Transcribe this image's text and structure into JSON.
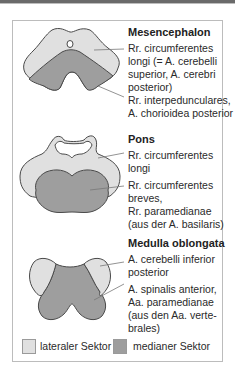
{
  "colors": {
    "lateral": "#e0e0e0",
    "median": "#9e9e9e",
    "outline": "#4a4a4a",
    "frame": "#bcbcbc"
  },
  "sections": [
    {
      "title": "Mesencephalon",
      "labels": [
        {
          "lines": [
            "Rr. circumferentes",
            "longi (= A. cerebelli",
            "superior, A. cerebri",
            "posterior)"
          ]
        },
        {
          "lines": [
            "Rr. interpedunculares,",
            "A. chorioidea posterior"
          ]
        }
      ]
    },
    {
      "title": "Pons",
      "labels": [
        {
          "lines": [
            "Rr. circumferentes",
            "longi"
          ]
        },
        {
          "lines": [
            "Rr. circumferentes",
            "breves,",
            "Rr. paramedianae",
            "(aus der A. basilaris)"
          ]
        }
      ]
    },
    {
      "title": "Medulla oblongata",
      "labels": [
        {
          "lines": [
            "A. cerebelli inferior",
            "posterior"
          ]
        },
        {
          "lines": [
            "A. spinalis anterior,",
            "Aa. paramedianae",
            "(aus den Aa. verte-",
            "brales)"
          ]
        }
      ]
    }
  ],
  "legend": [
    {
      "label": "lateraler Sektor",
      "color": "#e0e0e0"
    },
    {
      "label": "medianer Sektor",
      "color": "#9e9e9e"
    }
  ]
}
